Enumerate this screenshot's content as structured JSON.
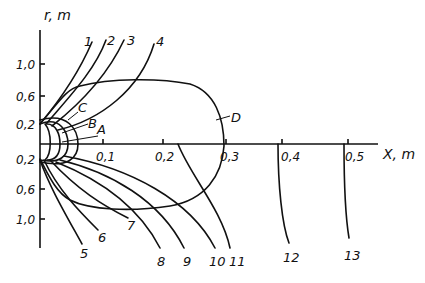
{
  "diagram": {
    "axes": {
      "y_label": "r, m",
      "x_label": "X, m",
      "y_ticks_upper": [
        "1,0",
        "0,6",
        "0,2"
      ],
      "y_ticks_lower": [
        "0,2",
        "0,6",
        "1,0"
      ],
      "x_ticks": [
        "0,1",
        "0,2",
        "0,3",
        "0,4",
        "0,5"
      ]
    },
    "region_labels": {
      "A": "A",
      "B": "B",
      "C": "C",
      "D": "D"
    },
    "curve_labels": [
      "1",
      "2",
      "3",
      "4",
      "5",
      "6",
      "7",
      "8",
      "9",
      "10",
      "11",
      "12",
      "13"
    ],
    "colors": {
      "ink": "#111111",
      "background": "#ffffff"
    }
  }
}
